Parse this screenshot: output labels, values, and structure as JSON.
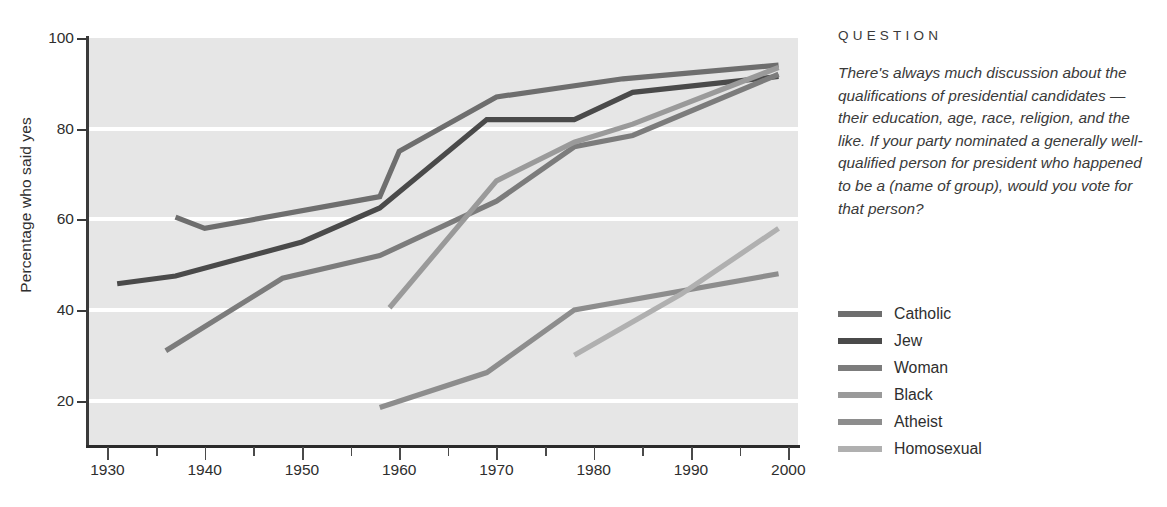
{
  "panel": {
    "header": "QUESTION",
    "question": "There's always much discussion about the qualifications of presidential candidates — their education, age, race, religion, and the like. If your party nominated a generally well-qualified person for president who happened to be a (name of group), would you vote for that person?"
  },
  "chart_data": {
    "type": "line",
    "title": "",
    "xlabel": "",
    "ylabel": "Percentage who said yes",
    "xlim": [
      1928,
      2001
    ],
    "ylim": [
      10,
      100
    ],
    "xticks": [
      1930,
      1940,
      1950,
      1960,
      1970,
      1980,
      1990,
      2000
    ],
    "xtick_labels": [
      "1930",
      "1940",
      "1950",
      "1960",
      "1970",
      "1980",
      "1990",
      "2000"
    ],
    "xminor_ticks": [
      1935,
      1945,
      1955,
      1965,
      1975,
      1985,
      1995
    ],
    "yticks": [
      20,
      40,
      60,
      80,
      100
    ],
    "ytick_labels": [
      "20",
      "40",
      "60",
      "80",
      "100"
    ],
    "gridlines": [
      20,
      40,
      60,
      80
    ],
    "grid": true,
    "grid_color": "#ffffff",
    "plot_background": "#e6e6e6",
    "legend_position": "right",
    "series": [
      {
        "name": "Catholic",
        "color": "#6e6e6e",
        "points": [
          [
            1937,
            60.5
          ],
          [
            1940,
            58.0
          ],
          [
            1958,
            65.0
          ],
          [
            1960,
            75.0
          ],
          [
            1970,
            87.0
          ],
          [
            1983,
            91.0
          ],
          [
            1999,
            94.0
          ]
        ]
      },
      {
        "name": "Jew",
        "color": "#4a4a4a",
        "points": [
          [
            1931,
            45.8
          ],
          [
            1937,
            47.5
          ],
          [
            1950,
            55.0
          ],
          [
            1958,
            62.5
          ],
          [
            1969,
            82.0
          ],
          [
            1978,
            82.0
          ],
          [
            1984,
            88.0
          ],
          [
            1999,
            91.5
          ]
        ]
      },
      {
        "name": "Woman",
        "color": "#7c7c7c",
        "points": [
          [
            1936,
            31.0
          ],
          [
            1948,
            47.0
          ],
          [
            1958,
            52.0
          ],
          [
            1970,
            64.0
          ],
          [
            1978,
            76.0
          ],
          [
            1984,
            78.5
          ],
          [
            1999,
            92.0
          ]
        ]
      },
      {
        "name": "Black",
        "color": "#9a9a9a",
        "points": [
          [
            1959,
            40.5
          ],
          [
            1970,
            68.5
          ],
          [
            1978,
            77.0
          ],
          [
            1984,
            81.0
          ],
          [
            1999,
            93.5
          ]
        ]
      },
      {
        "name": "Atheist",
        "color": "#8d8d8d",
        "points": [
          [
            1958,
            18.5
          ],
          [
            1969,
            26.2
          ],
          [
            1978,
            40.0
          ],
          [
            1999,
            48.0
          ]
        ]
      },
      {
        "name": "Homosexual",
        "color": "#b0b0b0",
        "points": [
          [
            1978,
            30.0
          ],
          [
            1989,
            43.5
          ],
          [
            1999,
            58.0
          ]
        ]
      }
    ]
  }
}
